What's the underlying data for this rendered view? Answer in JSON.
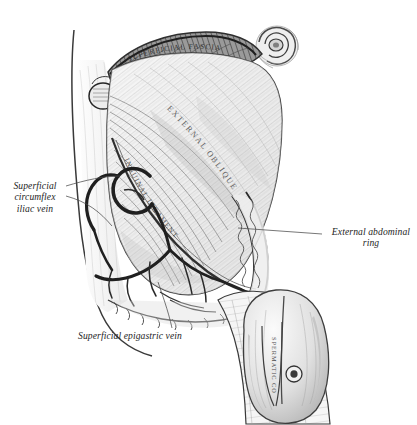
{
  "plate": {
    "title": "Dissection of the superficial structures of the groin and lower abdominal wall",
    "background_color": "#ffffff",
    "ink_color": "#2b2b2b",
    "tone_light": "#e9e9e9",
    "tone_mid": "#c9c9c9",
    "tone_dark": "#8d8d8d",
    "vein_color": "#2a2a2a"
  },
  "top_cropped_text": "· · ·",
  "callouts": [
    {
      "id": "superficial-circumflex-iliac-vein",
      "text": "Superficial\ncircumflex\niliac vein",
      "align": "center",
      "leader_from": [
        66,
        190
      ],
      "leader_to": [
        118,
        178
      ]
    },
    {
      "id": "external-abdominal-ring",
      "text": "External abdominal\nring",
      "align": "center",
      "leader_from": [
        322,
        234
      ],
      "leader_to": [
        247,
        228
      ]
    },
    {
      "id": "superficial-epigastric-vein",
      "text": "Superficial epigastric vein",
      "align": "left",
      "leader_from": [
        172,
        330
      ],
      "leader_to": [
        158,
        282
      ]
    }
  ],
  "in_figure_labels": [
    {
      "id": "superficial-fascia",
      "text": "SUPERFICIAL FASCIA",
      "placement": "curved along upper reflected fascia"
    },
    {
      "id": "external-oblique",
      "text": "EXTERNAL OBLIQUE",
      "placement": "diagonal across aponeurosis"
    },
    {
      "id": "inguinal-ligament",
      "text": "INGUINAL LIGAMENT",
      "placement": "along lower curved border"
    },
    {
      "id": "crest-label-oval",
      "text": "Crista ilii",
      "placement": "small oval, upper left"
    },
    {
      "id": "spermatic-cord",
      "text": "SPERMATIC CORD",
      "placement": "vertical, lower right"
    }
  ],
  "anatomy_parts": [
    "abdominal-wall-outline",
    "umbilicus",
    "reflected-superficial-fascia",
    "external-oblique-aponeurosis",
    "inguinal-ligament",
    "external-abdominal-ring",
    "superficial-circumflex-iliac-vein",
    "superficial-epigastric-vein",
    "spermatic-cord",
    "scrotum",
    "thigh"
  ]
}
